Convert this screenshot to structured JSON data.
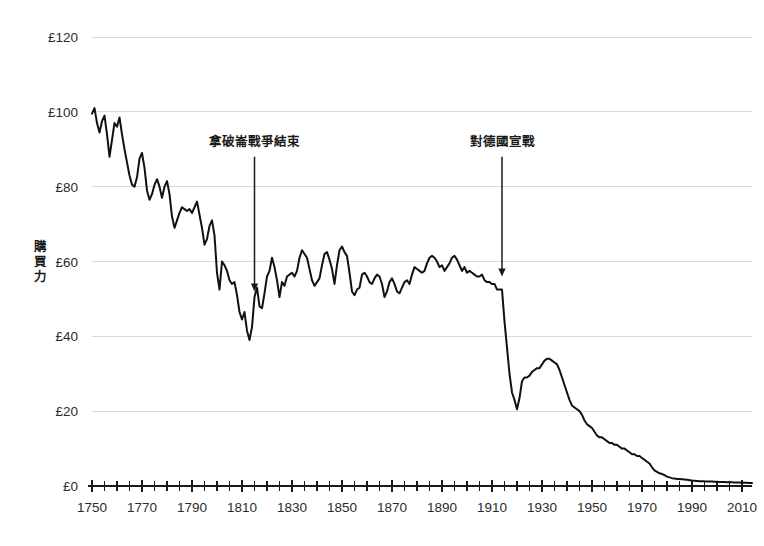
{
  "chart_data": {
    "type": "line",
    "title": "",
    "xlabel": "",
    "ylabel": "購買力",
    "xlim": [
      1750,
      2014
    ],
    "ylim": [
      0,
      120
    ],
    "grid": true,
    "legend": "none",
    "currency_symbol": "£",
    "y_ticks": [
      0,
      20,
      40,
      60,
      80,
      100,
      120
    ],
    "y_tick_labels": [
      "£0",
      "£20",
      "£40",
      "£60",
      "£80",
      "£100",
      "£120"
    ],
    "x_ticks": [
      1750,
      1770,
      1790,
      1810,
      1830,
      1850,
      1870,
      1890,
      1910,
      1930,
      1950,
      1970,
      1990,
      2010
    ],
    "x_tick_labels": [
      "1750",
      "1770",
      "1790",
      "1810",
      "1830",
      "1850",
      "1870",
      "1890",
      "1910",
      "1930",
      "1950",
      "1970",
      "1990",
      "2010"
    ],
    "x_minor_tick_step": 5,
    "series_name": "購買力",
    "line_color": "#111111",
    "grid_color": "#d9d9d9",
    "x": [
      1750,
      1751,
      1752,
      1753,
      1754,
      1755,
      1756,
      1757,
      1758,
      1759,
      1760,
      1761,
      1762,
      1763,
      1764,
      1765,
      1766,
      1767,
      1768,
      1769,
      1770,
      1771,
      1772,
      1773,
      1774,
      1775,
      1776,
      1777,
      1778,
      1779,
      1780,
      1781,
      1782,
      1783,
      1784,
      1785,
      1786,
      1787,
      1788,
      1789,
      1790,
      1791,
      1792,
      1793,
      1794,
      1795,
      1796,
      1797,
      1798,
      1799,
      1800,
      1801,
      1802,
      1803,
      1804,
      1805,
      1806,
      1807,
      1808,
      1809,
      1810,
      1811,
      1812,
      1813,
      1814,
      1815,
      1816,
      1817,
      1818,
      1819,
      1820,
      1821,
      1822,
      1823,
      1824,
      1825,
      1826,
      1827,
      1828,
      1829,
      1830,
      1831,
      1832,
      1833,
      1834,
      1835,
      1836,
      1837,
      1838,
      1839,
      1840,
      1841,
      1842,
      1843,
      1844,
      1845,
      1846,
      1847,
      1848,
      1849,
      1850,
      1851,
      1852,
      1853,
      1854,
      1855,
      1856,
      1857,
      1858,
      1859,
      1860,
      1861,
      1862,
      1863,
      1864,
      1865,
      1866,
      1867,
      1868,
      1869,
      1870,
      1871,
      1872,
      1873,
      1874,
      1875,
      1876,
      1877,
      1878,
      1879,
      1880,
      1881,
      1882,
      1883,
      1884,
      1885,
      1886,
      1887,
      1888,
      1889,
      1890,
      1891,
      1892,
      1893,
      1894,
      1895,
      1896,
      1897,
      1898,
      1899,
      1900,
      1901,
      1902,
      1903,
      1904,
      1905,
      1906,
      1907,
      1908,
      1909,
      1910,
      1911,
      1912,
      1913,
      1914,
      1915,
      1916,
      1917,
      1918,
      1919,
      1920,
      1921,
      1922,
      1923,
      1924,
      1925,
      1926,
      1927,
      1928,
      1929,
      1930,
      1931,
      1932,
      1933,
      1934,
      1935,
      1936,
      1937,
      1938,
      1939,
      1940,
      1941,
      1942,
      1943,
      1944,
      1945,
      1946,
      1947,
      1948,
      1949,
      1950,
      1951,
      1952,
      1953,
      1954,
      1955,
      1956,
      1957,
      1958,
      1959,
      1960,
      1961,
      1962,
      1963,
      1964,
      1965,
      1966,
      1967,
      1968,
      1969,
      1970,
      1971,
      1972,
      1973,
      1974,
      1975,
      1976,
      1977,
      1978,
      1979,
      1980,
      1981,
      1982,
      1983,
      1984,
      1985,
      1986,
      1987,
      1988,
      1989,
      1990,
      1991,
      1992,
      1993,
      1994,
      1995,
      1996,
      1997,
      1998,
      1999,
      2000,
      2001,
      2002,
      2003,
      2004,
      2005,
      2006,
      2007,
      2008,
      2009,
      2010,
      2011,
      2012,
      2013,
      2014
    ],
    "y": [
      99.5,
      101.0,
      97.0,
      94.5,
      97.5,
      99.0,
      94.0,
      88.0,
      92.5,
      97.0,
      96.0,
      98.5,
      94.0,
      90.0,
      86.5,
      83.0,
      80.5,
      80.0,
      82.5,
      87.5,
      89.0,
      85.0,
      79.0,
      76.5,
      78.0,
      80.5,
      82.0,
      80.0,
      77.0,
      80.0,
      81.5,
      78.0,
      72.0,
      69.0,
      71.0,
      73.0,
      74.5,
      74.0,
      73.5,
      74.0,
      73.0,
      74.5,
      76.0,
      72.5,
      69.0,
      64.5,
      66.0,
      69.5,
      71.0,
      67.0,
      57.0,
      52.5,
      60.0,
      59.0,
      57.5,
      55.0,
      54.0,
      54.5,
      51.0,
      46.5,
      44.5,
      46.5,
      41.5,
      39.0,
      42.5,
      50.5,
      53.0,
      48.0,
      47.5,
      51.5,
      56.0,
      57.5,
      61.0,
      58.5,
      55.0,
      50.5,
      54.5,
      53.5,
      56.0,
      56.5,
      57.0,
      56.0,
      57.5,
      61.0,
      63.0,
      62.0,
      61.0,
      58.0,
      55.0,
      53.5,
      54.5,
      55.5,
      59.0,
      62.0,
      62.5,
      60.5,
      58.0,
      54.0,
      59.0,
      63.0,
      64.0,
      62.5,
      61.5,
      57.0,
      52.0,
      51.0,
      52.5,
      53.0,
      56.5,
      57.0,
      56.0,
      54.5,
      54.0,
      55.5,
      56.5,
      56.0,
      54.0,
      50.5,
      52.0,
      54.5,
      55.5,
      54.0,
      52.0,
      51.5,
      53.0,
      54.5,
      55.0,
      54.0,
      56.5,
      58.5,
      58.0,
      57.5,
      57.0,
      57.5,
      59.5,
      61.0,
      61.5,
      61.0,
      60.0,
      58.5,
      59.0,
      57.5,
      58.5,
      59.5,
      61.0,
      61.5,
      60.5,
      59.0,
      57.5,
      58.5,
      57.0,
      57.5,
      57.0,
      56.5,
      56.0,
      56.0,
      56.5,
      55.0,
      54.5,
      54.5,
      54.0,
      54.0,
      52.5,
      52.5,
      52.5,
      44.0,
      37.0,
      30.0,
      25.0,
      23.0,
      20.5,
      23.5,
      28.0,
      29.0,
      29.0,
      29.5,
      30.5,
      31.0,
      31.5,
      31.5,
      32.5,
      33.5,
      34.0,
      34.0,
      33.5,
      33.0,
      32.5,
      31.0,
      29.0,
      27.0,
      25.0,
      23.0,
      21.5,
      21.0,
      20.5,
      20.0,
      19.0,
      17.5,
      16.5,
      16.0,
      15.5,
      14.5,
      13.5,
      13.0,
      13.0,
      12.5,
      12.0,
      11.5,
      11.5,
      11.0,
      11.0,
      10.5,
      10.0,
      10.0,
      9.5,
      9.0,
      8.5,
      8.5,
      8.0,
      8.0,
      7.5,
      7.0,
      6.5,
      6.0,
      5.0,
      4.2,
      3.8,
      3.4,
      3.2,
      2.9,
      2.5,
      2.3,
      2.1,
      2.0,
      1.9,
      1.85,
      1.8,
      1.75,
      1.65,
      1.55,
      1.45,
      1.4,
      1.35,
      1.3,
      1.3,
      1.25,
      1.22,
      1.2,
      1.18,
      1.15,
      1.12,
      1.1,
      1.08,
      1.05,
      1.02,
      1.0,
      0.98,
      0.95,
      0.92,
      0.92,
      0.9,
      0.87,
      0.84,
      0.82,
      0.8
    ],
    "annotations": [
      {
        "label": "拿破崙戰爭結束",
        "year": 1815,
        "text_value": 92,
        "arrow_from_value": 88,
        "arrow_to_value": 52
      },
      {
        "label": "對德國宣戰",
        "year": 1914,
        "text_value": 92,
        "arrow_from_value": 88,
        "arrow_to_value": 56
      }
    ]
  }
}
